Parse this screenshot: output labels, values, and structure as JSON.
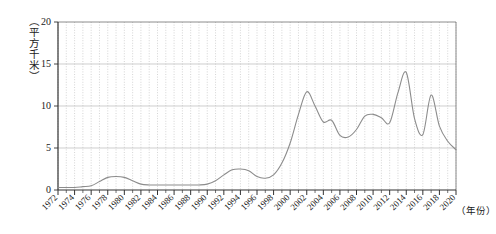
{
  "chart_data": {
    "type": "line",
    "title": "",
    "subtitle": "",
    "xlabel": "（年份）",
    "ylabel": "（平方千米）",
    "xlim": [
      1972,
      2020
    ],
    "ylim": [
      0,
      20
    ],
    "ytick_values": [
      0,
      5,
      10,
      15,
      20
    ],
    "ytick_labels": [
      "0",
      "5",
      "10",
      "15",
      "20"
    ],
    "xtick_values": [
      1972,
      1974,
      1976,
      1978,
      1980,
      1982,
      1984,
      1986,
      1988,
      1990,
      1992,
      1994,
      1996,
      1998,
      2000,
      2002,
      2004,
      2006,
      2008,
      2010,
      2012,
      2014,
      2016,
      2018,
      2020
    ],
    "xtick_labels": [
      "1972",
      "1974",
      "1976",
      "1978",
      "1980",
      "1982",
      "1984",
      "1986",
      "1988",
      "1990",
      "1992",
      "1994",
      "1996",
      "1998",
      "2000",
      "2002",
      "2004",
      "2006",
      "2008",
      "2010",
      "2012",
      "2014",
      "2016",
      "2018",
      "2020"
    ],
    "minor_xticks_every": 1,
    "grid": {
      "vertical": true,
      "vertical_style": "dotted",
      "horizontal": true,
      "horizontal_style": "solid",
      "color": "#b9b9b9"
    },
    "legend": null,
    "legend_position": "none",
    "line_color": "#8c8c8c",
    "line_width": 1.1,
    "series": [
      {
        "name": "面积",
        "x": [
          1972,
          1973,
          1974,
          1975,
          1976,
          1977,
          1978,
          1979,
          1980,
          1981,
          1982,
          1983,
          1984,
          1985,
          1986,
          1987,
          1988,
          1989,
          1990,
          1991,
          1992,
          1993,
          1994,
          1995,
          1996,
          1997,
          1998,
          1999,
          2000,
          2001,
          2002,
          2003,
          2004,
          2005,
          2006,
          2007,
          2008,
          2009,
          2010,
          2011,
          2012,
          2013,
          2014,
          2015,
          2016,
          2017,
          2018,
          2019,
          2020
        ],
        "values": [
          0.3,
          0.3,
          0.3,
          0.4,
          0.5,
          1.0,
          1.5,
          1.6,
          1.5,
          1.1,
          0.7,
          0.6,
          0.6,
          0.6,
          0.6,
          0.6,
          0.6,
          0.6,
          0.7,
          1.1,
          1.8,
          2.4,
          2.5,
          2.3,
          1.6,
          1.4,
          1.8,
          3.2,
          5.6,
          9.0,
          11.7,
          10.0,
          8.1,
          8.3,
          6.5,
          6.3,
          7.2,
          8.8,
          9.0,
          8.6,
          8.0,
          11.6,
          14.0,
          8.5,
          6.6,
          11.3,
          7.6,
          5.8,
          4.8
        ]
      }
    ]
  },
  "axis": {
    "y_unit_label": "（平方千米）",
    "x_unit_label": "（年份）"
  }
}
